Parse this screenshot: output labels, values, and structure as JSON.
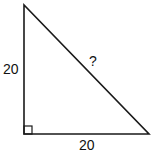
{
  "diagram": {
    "type": "right-triangle",
    "labels": {
      "left_side": "20",
      "bottom_side": "20",
      "hypotenuse": "?"
    },
    "right_angle_marker": "bottom-left",
    "stroke_color": "#1a1a1a"
  }
}
